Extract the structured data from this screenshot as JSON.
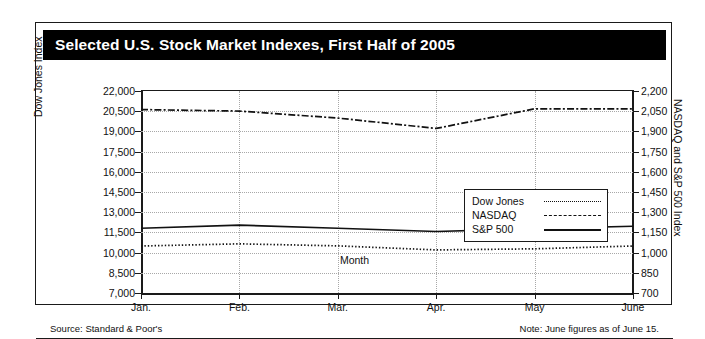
{
  "title": "Selected U.S. Stock Market Indexes, First Half of 2005",
  "source_note": "Source: Standard & Poor's",
  "june_note": "Note: June figures as of June 15.",
  "legend": {
    "items": [
      {
        "label": "Dow Jones",
        "style": "dotted"
      },
      {
        "label": "NASDAQ",
        "style": "dash-dot"
      },
      {
        "label": "S&P 500",
        "style": "solid"
      }
    ]
  },
  "chart_data": {
    "type": "line",
    "title": "Selected U.S. Stock Market Indexes, First Half of 2005",
    "xlabel": "Month",
    "ylabel": "Dow Jones Index",
    "y2label": "NASDAQ and S&P 500 Index",
    "categories": [
      "Jan.",
      "Feb.",
      "Mar.",
      "Apr.",
      "May",
      "June"
    ],
    "ylim": [
      7000,
      22000
    ],
    "yticks": [
      "7,000",
      "8,500",
      "10,000",
      "11,500",
      "13,000",
      "14,500",
      "16,000",
      "17,500",
      "19,000",
      "20,500",
      "22,000"
    ],
    "y2lim": [
      700,
      2200
    ],
    "y2ticks": [
      "700",
      "850",
      "1,000",
      "1,150",
      "1,300",
      "1,450",
      "1,600",
      "1,750",
      "1,900",
      "2,050",
      "2,200"
    ],
    "grid": true,
    "legend_position": "inside-center-right",
    "series": [
      {
        "name": "Dow Jones",
        "axis": "left",
        "style": "dotted",
        "values": [
          10490,
          10650,
          10500,
          10200,
          10280,
          10490
        ]
      },
      {
        "name": "NASDAQ",
        "axis": "right",
        "style": "dash-dot",
        "values": [
          2062,
          2051,
          1999,
          1922,
          2068,
          2068
        ]
      },
      {
        "name": "S&P 500",
        "axis": "right",
        "style": "solid",
        "values": [
          1181,
          1204,
          1181,
          1157,
          1178,
          1196
        ]
      }
    ]
  }
}
